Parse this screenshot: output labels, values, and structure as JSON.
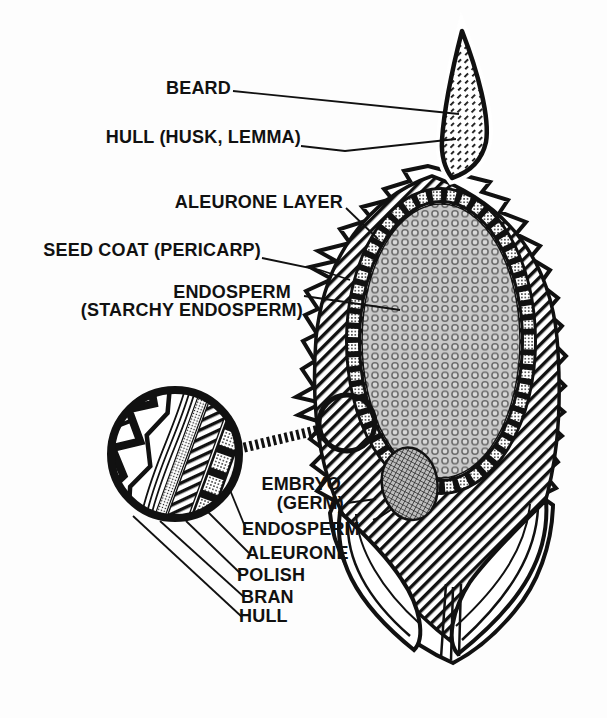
{
  "palette": {
    "ink": "#111111",
    "paper": "#fdfdfd",
    "endosperm_gray": "#c8c8c8",
    "embryo_gray": "#bdbdbd"
  },
  "labels": {
    "beard": "BEARD",
    "hull_husk_lemma": "HULL (HUSK, LEMMA)",
    "aleurone_layer": "ALEURONE LAYER",
    "seed_coat_pericarp": "SEED COAT (PERICARP)",
    "endosperm_line1": "ENDOSPERM",
    "endosperm_line2": "(STARCHY ENDOSPERM)",
    "embryo_line1": "EMBRYO",
    "embryo_line2": "(GERM)",
    "inset_layers": [
      "ENDOSPERM",
      "ALEURONE",
      "POLISH",
      "BRAN",
      "HULL"
    ]
  }
}
